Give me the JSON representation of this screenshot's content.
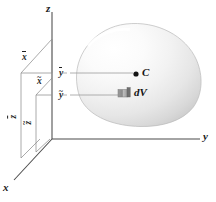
{
  "figure": {
    "background_color": "#ffffff"
  },
  "axes": {
    "z": {
      "label": "z",
      "x": 46,
      "y": 3
    },
    "y": {
      "label": "y",
      "x": 203,
      "y": 133
    },
    "x": {
      "label": "x",
      "x": 3,
      "y": 184
    },
    "origin": {
      "x": 52,
      "y": 139
    },
    "color": "#4a4a4a"
  },
  "centroid": {
    "point_label": "C",
    "dot_color": "#141414",
    "dot_x": 136,
    "dot_y": 74,
    "label_x": 142,
    "label_y": 68
  },
  "element": {
    "label_d": "d",
    "label_v": "V",
    "fill_color": "#8f8f8f",
    "x": 119,
    "y": 92,
    "label_x": 134,
    "label_y": 88
  },
  "coordinate_labels": {
    "x_bar": {
      "text": "x",
      "accent": "bar",
      "x": 22,
      "y": 53
    },
    "x_tilde": {
      "text": "x",
      "accent": "tilde",
      "x": 37,
      "y": 77
    },
    "y_bar": {
      "text": "y",
      "accent": "bar",
      "x": 59,
      "y": 69
    },
    "y_tilde": {
      "text": "y",
      "accent": "tilde",
      "x": 59,
      "y": 91
    },
    "z_bar": {
      "text": "z",
      "accent": "bar",
      "x": 13,
      "y": 113
    },
    "z_tilde": {
      "text": "z",
      "accent": "tilde",
      "x": 28,
      "y": 119
    }
  },
  "body": {
    "shape": "rounded-blob",
    "highlight_color": "#fdfdfd",
    "mid_color": "#e8e8e8",
    "shadow_color": "#c9c9c9",
    "outline_color": "#b4b4b4"
  },
  "construction_lines": {
    "color": "#8a8a8a",
    "leader_color": "#9a9a9a"
  }
}
